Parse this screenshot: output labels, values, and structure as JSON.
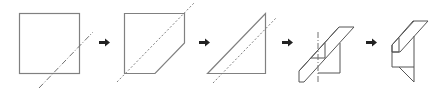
{
  "diagram": {
    "type": "paper-folding-sequence",
    "step_count": 5,
    "colors": {
      "edge": "#808080",
      "fold_line": "#707070",
      "arrow": "#222222",
      "background": "#ffffff"
    },
    "steps": [
      {
        "index": 1,
        "shape": "square",
        "fold_line": "dash-dot diagonal across lower-right corner"
      },
      {
        "index": 2,
        "shape": "square with lower-right corner folded (pentagon)",
        "fold_line": "dotted diagonal"
      },
      {
        "index": 3,
        "shape": "right triangle",
        "fold_line": "dotted diagonal parallel to hypotenuse"
      },
      {
        "index": 4,
        "shape": "triangle with folded strip",
        "fold_line": "dash-dot vertical"
      },
      {
        "index": 5,
        "shape": "final folded shape",
        "fold_line": "none"
      }
    ],
    "arrows": [
      {
        "from": 1,
        "to": 2,
        "glyph": "right-arrow"
      },
      {
        "from": 2,
        "to": 3,
        "glyph": "right-arrow"
      },
      {
        "from": 3,
        "to": 4,
        "glyph": "right-arrow"
      },
      {
        "from": 4,
        "to": 5,
        "glyph": "right-arrow"
      }
    ]
  }
}
